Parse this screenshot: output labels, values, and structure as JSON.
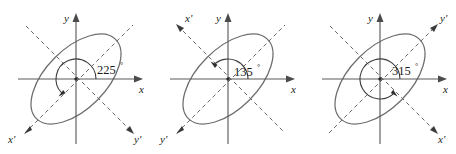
{
  "figure": {
    "type": "rotated-conic-axes-diagram",
    "panel_count": 3,
    "colors": {
      "axis": "#5b5b5b",
      "rotated_axis": "#6a6a6a",
      "ellipse": "#6d6d6d",
      "arc": "#3c3c3c",
      "text": "#1a1a1a",
      "background": "#ffffff"
    }
  },
  "panels": [
    {
      "id": "panel-225",
      "angle_label": "225",
      "degree_symbol": "°",
      "x_label": "x",
      "y_label": "y",
      "x_prime_label": "x'",
      "y_prime_label": "y'",
      "x_prime_position": "bottom-left",
      "y_prime_position": "bottom-right",
      "arc_sweep_degrees": 225,
      "arc_direction": "counterclockwise",
      "ellipse_tilt_degrees": 45
    },
    {
      "id": "panel-135",
      "angle_label": "135",
      "degree_symbol": "°",
      "x_label": "x",
      "y_label": "y",
      "x_prime_label": "x'",
      "y_prime_label": "y'",
      "x_prime_position": "top-left",
      "y_prime_position": "bottom-left",
      "arc_sweep_degrees": 135,
      "arc_direction": "counterclockwise",
      "ellipse_tilt_degrees": 45
    },
    {
      "id": "panel-315",
      "angle_label": "315",
      "degree_symbol": "°",
      "x_label": "x",
      "y_label": "y",
      "x_prime_label": "x'",
      "y_prime_label": "y'",
      "x_prime_position": "bottom-right",
      "y_prime_position": "top-right",
      "arc_sweep_degrees": 315,
      "arc_direction": "counterclockwise",
      "ellipse_tilt_degrees": 45
    }
  ]
}
